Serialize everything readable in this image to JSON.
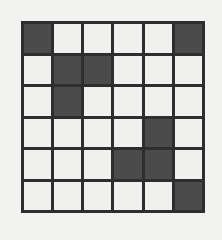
{
  "puzzle": {
    "title": "Grid Pattern",
    "rows": 6,
    "columns": 6,
    "filled_color": "#4b4b4b",
    "empty_color": "#f0f0ee",
    "gridline_color": "#2e2e2e",
    "background_color": "#f2f2f0",
    "filled_count": 9,
    "cells": [
      [
        1,
        0,
        0,
        0,
        0,
        1
      ],
      [
        0,
        1,
        1,
        0,
        0,
        0
      ],
      [
        0,
        1,
        0,
        0,
        0,
        0
      ],
      [
        0,
        0,
        0,
        0,
        1,
        0
      ],
      [
        0,
        0,
        0,
        1,
        1,
        0
      ],
      [
        0,
        0,
        0,
        0,
        0,
        1
      ]
    ],
    "filled_coordinates": [
      {
        "row": 1,
        "col": 1
      },
      {
        "row": 1,
        "col": 6
      },
      {
        "row": 2,
        "col": 2
      },
      {
        "row": 2,
        "col": 3
      },
      {
        "row": 3,
        "col": 2
      },
      {
        "row": 4,
        "col": 5
      },
      {
        "row": 5,
        "col": 4
      },
      {
        "row": 5,
        "col": 5
      },
      {
        "row": 6,
        "col": 6
      }
    ]
  }
}
